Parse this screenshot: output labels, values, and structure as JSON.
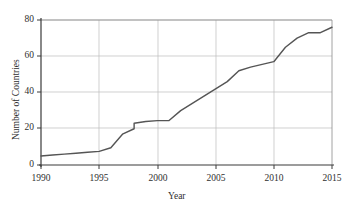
{
  "chart_data": {
    "type": "line",
    "title": "",
    "xlabel": "Year",
    "ylabel": "Number of Countries",
    "xlim": [
      1990,
      2015
    ],
    "ylim": [
      0,
      80
    ],
    "xticks": [
      1990,
      1995,
      2000,
      2005,
      2010,
      2015
    ],
    "yticks": [
      0,
      20,
      40,
      60,
      80
    ],
    "grid": true,
    "legend": "none",
    "line_color": "#555555",
    "grid_color": "#bbbbbb",
    "axis_color": "#444444",
    "series": [
      {
        "name": "Number of Countries",
        "x": [
          1990,
          1991,
          1992,
          1993,
          1994,
          1995,
          1996,
          1997,
          1998,
          1998,
          1999,
          2000,
          2001,
          2002,
          2003,
          2004,
          2005,
          2006,
          2007,
          2008,
          2009,
          2010,
          2011,
          2012,
          2013,
          2014,
          2015
        ],
        "values": [
          5,
          5.5,
          6,
          6.5,
          7,
          7.5,
          9.5,
          17,
          20,
          23,
          24,
          24.5,
          24.5,
          30,
          34,
          38,
          42,
          46,
          52,
          54,
          55.5,
          57,
          65,
          70,
          73,
          73,
          76
        ]
      }
    ]
  }
}
